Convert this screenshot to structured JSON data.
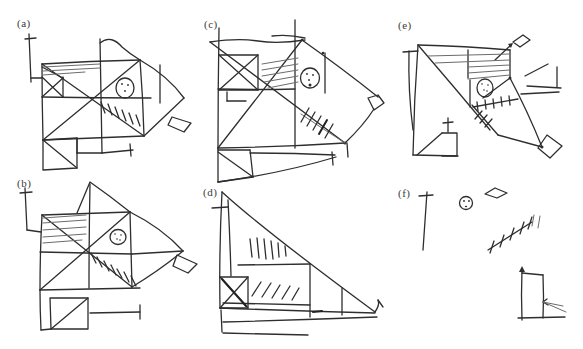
{
  "figure": {
    "background_color": "#ffffff",
    "ink_color": "#2e2e2e",
    "panels": [
      {
        "id": "a",
        "label": "(a)"
      },
      {
        "id": "b",
        "label": "(b)"
      },
      {
        "id": "c",
        "label": "(c)"
      },
      {
        "id": "d",
        "label": "(d)"
      },
      {
        "id": "e",
        "label": "(e)"
      },
      {
        "id": "f",
        "label": "(f)"
      }
    ]
  }
}
